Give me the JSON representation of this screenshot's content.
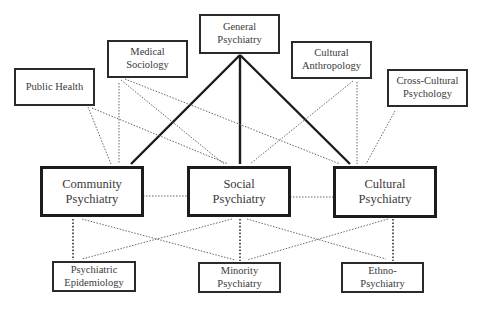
{
  "diagram": {
    "type": "concept-map",
    "nodes": {
      "general_psychiatry": {
        "line1": "General",
        "line2": "Psychiatry"
      },
      "medical_sociology": {
        "line1": "Medical",
        "line2": "Sociology"
      },
      "public_health": {
        "line1": "Public Health",
        "line2": ""
      },
      "cultural_anthropology": {
        "line1": "Cultural",
        "line2": "Anthropology"
      },
      "cross_cultural_psychology": {
        "line1": "Cross-Cultural",
        "line2": "Psychology"
      },
      "community_psychiatry": {
        "line1": "Community",
        "line2": "Psychiatry"
      },
      "social_psychiatry": {
        "line1": "Social",
        "line2": "Psychiatry"
      },
      "cultural_psychiatry": {
        "line1": "Cultural",
        "line2": "Psychiatry"
      },
      "psychiatric_epidemiology": {
        "line1": "Psychiatric",
        "line2": "Epidemiology"
      },
      "minority_psychiatry": {
        "line1": "Minority",
        "line2": "Psychiatry"
      },
      "ethno_psychiatry": {
        "line1": "Ethno-",
        "line2": "Psychiatry"
      }
    },
    "edges": [
      {
        "from": "General Psychiatry",
        "to": "Community Psychiatry",
        "style": "solid-thick"
      },
      {
        "from": "General Psychiatry",
        "to": "Social Psychiatry",
        "style": "solid-thick"
      },
      {
        "from": "General Psychiatry",
        "to": "Cultural Psychiatry",
        "style": "solid-thick"
      },
      {
        "from": "Public Health",
        "to": "Community Psychiatry",
        "style": "dotted"
      },
      {
        "from": "Public Health",
        "to": "Social Psychiatry",
        "style": "dotted"
      },
      {
        "from": "Medical Sociology",
        "to": "Community Psychiatry",
        "style": "dotted"
      },
      {
        "from": "Medical Sociology",
        "to": "Social Psychiatry",
        "style": "dotted"
      },
      {
        "from": "Medical Sociology",
        "to": "Cultural Psychiatry",
        "style": "dotted"
      },
      {
        "from": "Cultural Anthropology",
        "to": "Social Psychiatry",
        "style": "dotted"
      },
      {
        "from": "Cultural Anthropology",
        "to": "Cultural Psychiatry",
        "style": "dotted"
      },
      {
        "from": "Cross-Cultural Psychology",
        "to": "Cultural Psychiatry",
        "style": "dotted"
      },
      {
        "from": "Community Psychiatry",
        "to": "Social Psychiatry",
        "style": "dotted"
      },
      {
        "from": "Social Psychiatry",
        "to": "Cultural Psychiatry",
        "style": "dotted"
      },
      {
        "from": "Community Psychiatry",
        "to": "Psychiatric Epidemiology",
        "style": "dotted-heavy"
      },
      {
        "from": "Community Psychiatry",
        "to": "Minority Psychiatry",
        "style": "dotted"
      },
      {
        "from": "Social Psychiatry",
        "to": "Psychiatric Epidemiology",
        "style": "dotted"
      },
      {
        "from": "Social Psychiatry",
        "to": "Minority Psychiatry",
        "style": "dotted-heavy"
      },
      {
        "from": "Social Psychiatry",
        "to": "Ethno-Psychiatry",
        "style": "dotted"
      },
      {
        "from": "Cultural Psychiatry",
        "to": "Minority Psychiatry",
        "style": "dotted"
      },
      {
        "from": "Cultural Psychiatry",
        "to": "Ethno-Psychiatry",
        "style": "dotted-heavy"
      }
    ],
    "colors": {
      "line": "#1c1c1c",
      "dotted": "#555555",
      "text": "#3a3a3a",
      "background": "#ffffff"
    }
  }
}
